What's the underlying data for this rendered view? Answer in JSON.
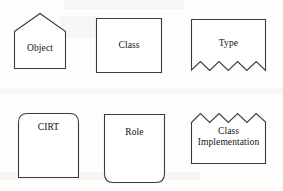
{
  "diagram": {
    "background_color": "#fdfdfc",
    "stroke_color": "#3b3b3b",
    "text_color": "#14120f",
    "shapes": [
      {
        "id": "object",
        "label": "Object",
        "symbol": "pentagon-house",
        "description": "Rectangle with peaked (pointed) top",
        "row": 1,
        "column": 1
      },
      {
        "id": "class",
        "label": "Class",
        "symbol": "rectangle",
        "description": "Plain rectangle",
        "row": 1,
        "column": 2
      },
      {
        "id": "type",
        "label": "Type",
        "symbol": "torn-bottom",
        "description": "Rectangle with zigzag torn bottom edge",
        "row": 1,
        "column": 3,
        "zigzag_peaks": 4
      },
      {
        "id": "cirt",
        "label": "CIRT",
        "symbol": "rounded-top",
        "description": "Rectangle with rounded top corners",
        "row": 2,
        "column": 1
      },
      {
        "id": "role",
        "label": "Role",
        "symbol": "rounded-bottom",
        "description": "Rectangle with rounded bottom corners",
        "row": 2,
        "column": 2
      },
      {
        "id": "class-implementation",
        "label": "Class\nImplementation",
        "symbol": "torn-top",
        "description": "Rectangle with zigzag torn top edge",
        "row": 2,
        "column": 3,
        "zigzag_peaks": 4
      }
    ]
  }
}
